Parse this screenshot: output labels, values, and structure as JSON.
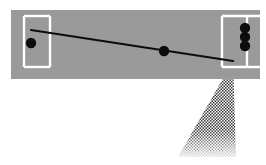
{
  "figure": {
    "name": "pitch-trajectory-diagram",
    "type": "diagram",
    "canvas": {
      "width": 266,
      "height": 165
    },
    "background_color": "#ffffff"
  },
  "field": {
    "label": "playing-field",
    "fill_color": "#9a9a9a",
    "x": 11,
    "y": 10,
    "width": 249,
    "height": 69
  },
  "markings": {
    "line_color": "#ffffff",
    "line_width": 2.4,
    "left_goal_area": {
      "label": "left-penalty-box",
      "x": 24,
      "y": 16,
      "width": 26,
      "height": 51
    },
    "right_goal_area": {
      "label": "right-penalty-box",
      "x": 222,
      "y": 16,
      "width": 38,
      "height": 51
    },
    "right_center_line": {
      "label": "right-goal-center-line",
      "x": 247,
      "y1": 16,
      "y2": 67
    }
  },
  "players": [
    {
      "label": "left-player-marker",
      "cx": 31,
      "cy": 43,
      "r": 5.2,
      "color": "#0d0d0d"
    },
    {
      "label": "ball-marker-midfield",
      "cx": 164,
      "cy": 51,
      "r": 5.2,
      "color": "#0d0d0d"
    },
    {
      "label": "right-player-marker-top",
      "cx": 245,
      "cy": 28,
      "r": 5.2,
      "color": "#0d0d0d"
    },
    {
      "label": "right-player-marker-middle",
      "cx": 245,
      "cy": 37,
      "r": 5.2,
      "color": "#0d0d0d"
    },
    {
      "label": "right-player-marker-bottom",
      "cx": 245,
      "cy": 46,
      "r": 5.2,
      "color": "#0d0d0d"
    }
  ],
  "trajectory": {
    "label": "pass-trajectory-line",
    "color": "#0d0d0d",
    "width": 2.2,
    "start_x": 31,
    "start_y": 30,
    "end_x": 233,
    "end_y": 61
  },
  "cone": {
    "label": "shot-visibility-cone",
    "pattern": "halftone-dots",
    "dot_color": "#3a3a3a",
    "apex_x": 233,
    "apex_y": 61,
    "left_x": 178,
    "left_y": 157,
    "right_x": 236,
    "right_y": 157,
    "fade": true
  },
  "colors": {
    "field": "#9a9a9a",
    "markings": "#ffffff",
    "markers": "#0d0d0d",
    "cone": "#3a3a3a",
    "page_background": "#ffffff"
  }
}
